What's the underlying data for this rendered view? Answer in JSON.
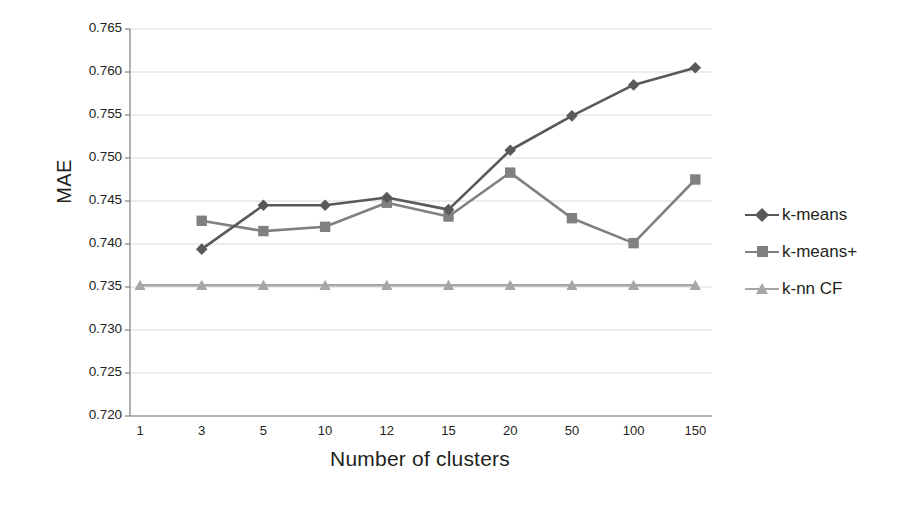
{
  "chart_data": {
    "type": "line",
    "title": "",
    "xlabel": "Number of clusters",
    "ylabel": "MAE",
    "categories": [
      "1",
      "3",
      "5",
      "10",
      "12",
      "15",
      "20",
      "50",
      "100",
      "150"
    ],
    "ylim": [
      0.72,
      0.765
    ],
    "ytick_step": 0.005,
    "ytick_labels": [
      "0.765",
      "0.760",
      "0.755",
      "0.750",
      "0.745",
      "0.740",
      "0.735",
      "0.730",
      "0.725",
      "0.720"
    ],
    "ytick_values": [
      0.765,
      0.76,
      0.755,
      0.75,
      0.745,
      0.74,
      0.735,
      0.73,
      0.725,
      0.72
    ],
    "grid": true,
    "grid_axis": "y",
    "legend_position": "right",
    "series": [
      {
        "name": "k-means",
        "marker": "diamond",
        "color": "#595959",
        "values": [
          null,
          0.7394,
          0.7445,
          0.7445,
          0.7454,
          0.744,
          0.7509,
          0.7549,
          0.7585,
          0.7605
        ]
      },
      {
        "name": "k-means+",
        "marker": "square",
        "color": "#808080",
        "values": [
          null,
          0.7427,
          0.7415,
          0.742,
          0.7448,
          0.7432,
          0.7483,
          0.743,
          0.7401,
          0.7475
        ]
      },
      {
        "name": "k-nn CF",
        "marker": "triangle",
        "color": "#a6a6a6",
        "values": [
          0.7352,
          0.7352,
          0.7352,
          0.7352,
          0.7352,
          0.7352,
          0.7352,
          0.7352,
          0.7352,
          0.7352
        ]
      }
    ]
  },
  "legend": {
    "items": [
      {
        "label": "k-means"
      },
      {
        "label": "k-means+"
      },
      {
        "label": "k-nn CF"
      }
    ]
  },
  "axes": {
    "y_title": "MAE",
    "x_title": "Number of clusters"
  },
  "colors": {
    "series_1": "#595959",
    "series_2": "#808080",
    "series_3": "#a6a6a6",
    "grid": "#d9d9d9",
    "axis": "#7f7f7f",
    "text": "#231f20",
    "background": "#ffffff"
  }
}
